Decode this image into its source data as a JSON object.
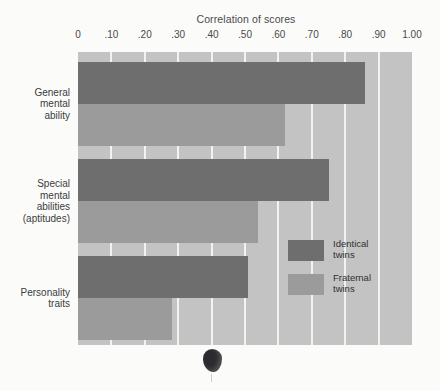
{
  "chart_data": {
    "type": "bar",
    "orientation": "horizontal",
    "title": "Correlation of scores",
    "xlabel": "Correlation of scores",
    "ylabel": "",
    "xlim": [
      0,
      1.0
    ],
    "grid": true,
    "legend_position": "inside-right",
    "categories": [
      "General\nmental\nability",
      "Special\nmental\nabilities\n(aptitudes)",
      "Personality\ntraits"
    ],
    "tick_labels": [
      "0",
      ".10",
      ".20",
      ".30",
      ".40",
      ".50",
      ".60",
      ".70",
      ".80",
      ".90",
      "1.00"
    ],
    "tick_values": [
      0,
      0.1,
      0.2,
      0.3,
      0.4,
      0.5,
      0.6,
      0.7,
      0.8,
      0.9,
      1.0
    ],
    "series": [
      {
        "name": "Identical\ntwins",
        "color": "#6e6e6e",
        "values": [
          0.86,
          0.75,
          0.51
        ]
      },
      {
        "name": "Fraternal\ntwins",
        "color": "#9b9b9b",
        "values": [
          0.62,
          0.54,
          0.28
        ]
      }
    ]
  },
  "legend": {
    "entries": [
      {
        "label": "Identical\ntwins",
        "color": "#6e6e6e"
      },
      {
        "label": "Fraternal\ntwins",
        "color": "#9b9b9b"
      }
    ]
  },
  "colors": {
    "plot_background": "#c3c3c3",
    "gridline": "#f2f2f0",
    "page_background": "#fbfbfa",
    "identical": "#6e6e6e",
    "fraternal": "#9b9b9b",
    "text": "#3c3c3c"
  }
}
